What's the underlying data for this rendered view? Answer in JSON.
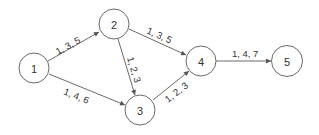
{
  "diagram": {
    "type": "directed-network",
    "nodes": [
      {
        "id": "1",
        "label": "1",
        "x": 34,
        "y": 68
      },
      {
        "id": "2",
        "label": "2",
        "x": 114,
        "y": 24
      },
      {
        "id": "3",
        "label": "3",
        "x": 140,
        "y": 110
      },
      {
        "id": "4",
        "label": "4",
        "x": 201,
        "y": 61
      },
      {
        "id": "5",
        "label": "5",
        "x": 287,
        "y": 60
      }
    ],
    "edges": [
      {
        "from": "1",
        "to": "2",
        "label": "1, 3, 5"
      },
      {
        "from": "1",
        "to": "3",
        "label": "1, 4, 6"
      },
      {
        "from": "2",
        "to": "3",
        "label": "1, 2, 3"
      },
      {
        "from": "2",
        "to": "4",
        "label": "1, 3, 5"
      },
      {
        "from": "3",
        "to": "4",
        "label": "1, 2, 3"
      },
      {
        "from": "4",
        "to": "5",
        "label": "1, 4, 7"
      }
    ],
    "colors": {
      "stroke": "#6a6a6a",
      "text": "#333333",
      "background": "#ffffff"
    }
  }
}
